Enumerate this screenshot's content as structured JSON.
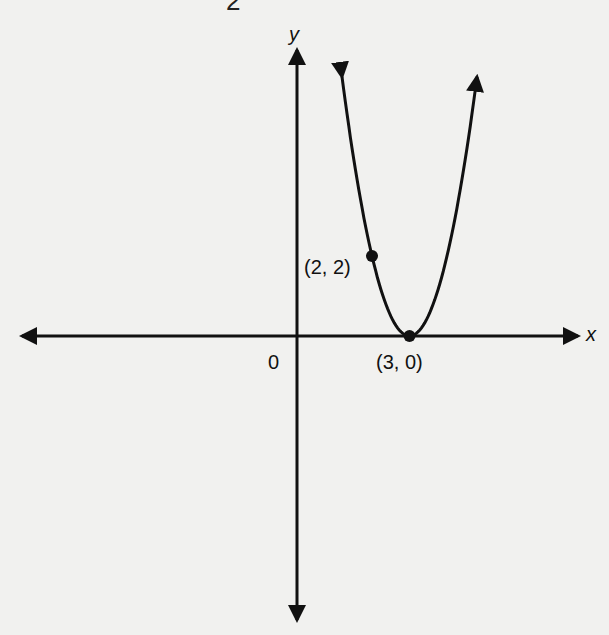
{
  "header_fragment": "2",
  "chart_data": {
    "type": "line",
    "title": "",
    "equation": "y = 2(x - 3)^2",
    "xlabel": "x",
    "ylabel": "y",
    "origin_label": "0",
    "grid": false,
    "x_range_px": [
      22,
      580
    ],
    "origin_px": [
      297,
      336
    ],
    "unit_px": {
      "x": 37.5,
      "y": 40
    },
    "curve": {
      "x_min": 1.2,
      "x_max": 4.8,
      "vertex": [
        3,
        0
      ],
      "a": 2
    },
    "points": [
      {
        "x": 2,
        "y": 2,
        "label": "(2, 2)"
      },
      {
        "x": 3,
        "y": 0,
        "label": "(3, 0)"
      }
    ]
  },
  "colors": {
    "ink": "#111111",
    "paper": "#f1f1ef"
  }
}
